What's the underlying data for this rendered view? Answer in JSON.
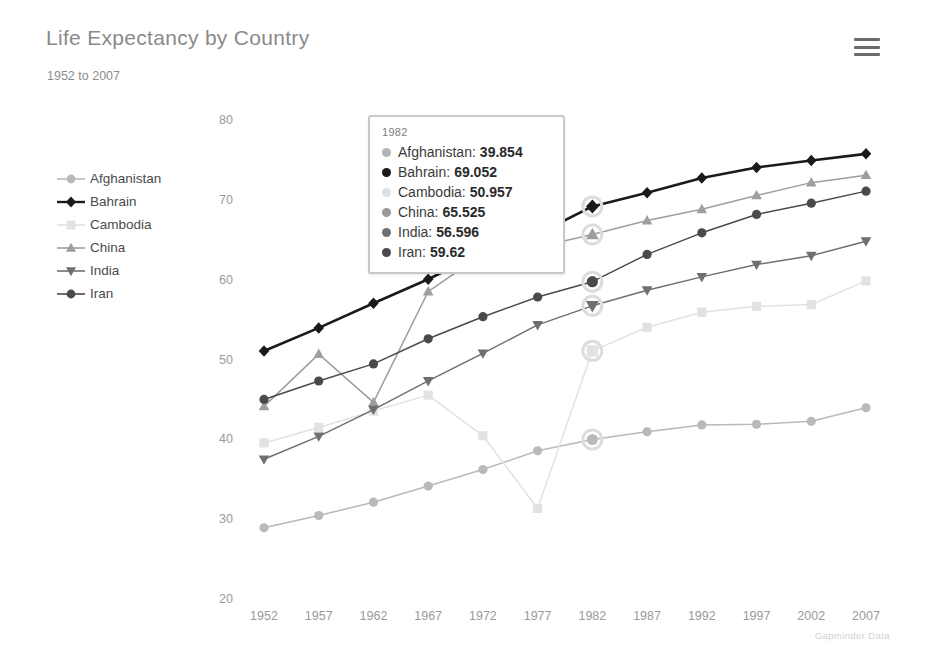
{
  "header": {
    "title": "Life Expectancy by Country",
    "subtitle": "1952 to 2007",
    "menu_icon": "hamburger-menu-icon"
  },
  "attribution": "Gapminder Data",
  "tooltip": {
    "date": "1982",
    "rows": [
      {
        "name": "Afghanistan:",
        "value": "39.854",
        "color": "#b5b5b5"
      },
      {
        "name": "Bahrain:",
        "value": "69.052",
        "color": "#1a1a1a"
      },
      {
        "name": "Cambodia:",
        "value": "50.957",
        "color": "#e0e0e0"
      },
      {
        "name": "China:",
        "value": "65.525",
        "color": "#9a9a9a"
      },
      {
        "name": "India:",
        "value": "56.596",
        "color": "#707070"
      },
      {
        "name": "Iran:",
        "value": "59.62",
        "color": "#4a4a4a"
      }
    ]
  },
  "legend": {
    "items": [
      {
        "label": "Afghanistan",
        "color": "#b9b9b9",
        "marker": "circle-marker"
      },
      {
        "label": "Bahrain",
        "color": "#1a1a1a",
        "marker": "diamond-marker"
      },
      {
        "label": "Cambodia",
        "color": "#e2e2e2",
        "marker": "square-marker"
      },
      {
        "label": "China",
        "color": "#9e9e9e",
        "marker": "triangle-up-marker"
      },
      {
        "label": "India",
        "color": "#6f6f6f",
        "marker": "triangle-down-marker"
      },
      {
        "label": "Iran",
        "color": "#4a4a4a",
        "marker": "circle-marker"
      }
    ]
  },
  "chart_data": {
    "type": "line",
    "title": "Life Expectancy by Country",
    "subtitle": "1952 to 2007",
    "xlabel": "",
    "ylabel": "",
    "grid": false,
    "legend_position": "left",
    "x": [
      1952,
      1957,
      1962,
      1967,
      1972,
      1977,
      1982,
      1987,
      1992,
      1997,
      2002,
      2007
    ],
    "xticklabels": [
      "1952",
      "1957",
      "1962",
      "1967",
      "1972",
      "1977",
      "1982",
      "1987",
      "1992",
      "1997",
      "2002",
      "2007"
    ],
    "yticks": [
      20,
      30,
      40,
      50,
      60,
      70,
      80
    ],
    "yticklabels": [
      "20",
      "30",
      "40",
      "50",
      "60",
      "70",
      "80"
    ],
    "ylim": [
      20,
      80
    ],
    "highlight_x": 1982,
    "series": [
      {
        "name": "Afghanistan",
        "color": "#b9b9b9",
        "marker": "circle",
        "values": [
          28.801,
          30.332,
          31.997,
          34.02,
          36.088,
          38.438,
          39.854,
          40.822,
          41.674,
          41.763,
          42.129,
          43.828
        ]
      },
      {
        "name": "Bahrain",
        "color": "#1a1a1a",
        "marker": "diamond",
        "values": [
          50.939,
          53.832,
          56.923,
          59.923,
          63.3,
          65.593,
          69.052,
          70.75,
          72.601,
          73.925,
          74.795,
          75.635
        ]
      },
      {
        "name": "Cambodia",
        "color": "#e2e2e2",
        "marker": "square",
        "values": [
          39.417,
          41.366,
          43.415,
          45.415,
          40.317,
          31.22,
          50.957,
          53.914,
          55.803,
          56.534,
          56.752,
          59.723
        ]
      },
      {
        "name": "China",
        "color": "#9e9e9e",
        "marker": "triangle-up",
        "values": [
          44.0,
          50.54896,
          44.50136,
          58.38112,
          63.11888,
          63.96736,
          65.525,
          67.274,
          68.69,
          70.426,
          72.028,
          72.961
        ]
      },
      {
        "name": "India",
        "color": "#6f6f6f",
        "marker": "triangle-down",
        "values": [
          37.373,
          40.249,
          43.605,
          47.193,
          50.651,
          54.208,
          56.596,
          58.553,
          60.223,
          61.765,
          62.879,
          64.698
        ]
      },
      {
        "name": "Iran",
        "color": "#4a4a4a",
        "marker": "circle",
        "values": [
          44.869,
          47.181,
          49.325,
          52.469,
          55.234,
          57.702,
          59.62,
          63.04,
          65.742,
          68.042,
          69.451,
          70.964
        ]
      }
    ]
  }
}
